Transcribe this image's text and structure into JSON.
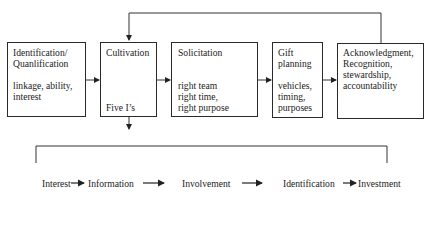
{
  "diagram": {
    "boxes": [
      {
        "id": "identification",
        "title_lines": [
          "Identification/",
          "Quanlification"
        ],
        "detail_lines": [
          "linkage, ability,",
          "interest"
        ]
      },
      {
        "id": "cultivation",
        "title_lines": [
          "Cultivation"
        ],
        "detail_lines": [
          "Five I’s"
        ]
      },
      {
        "id": "solicitation",
        "title_lines": [
          "Solicitation"
        ],
        "detail_lines": [
          "right team",
          "right time,",
          "right purpose"
        ]
      },
      {
        "id": "gift-planning",
        "title_lines": [
          "Gift",
          "planning"
        ],
        "detail_lines": [
          "vehicles,",
          "timing,",
          "purposes"
        ]
      },
      {
        "id": "acknowledgment",
        "title_lines": [
          "Acknowledgment,",
          "Recognition,",
          "stewardship,",
          "accountability"
        ],
        "detail_lines": []
      }
    ],
    "five_is_sequence": [
      "Interest",
      "Information",
      "Involvement",
      "Identification",
      "Investment"
    ],
    "connections": [
      {
        "from": "identification",
        "to": "cultivation",
        "type": "arrow"
      },
      {
        "from": "cultivation",
        "to": "solicitation",
        "type": "arrow"
      },
      {
        "from": "solicitation",
        "to": "gift-planning",
        "type": "arrow"
      },
      {
        "from": "gift-planning",
        "to": "acknowledgment",
        "type": "arrow"
      },
      {
        "from": "acknowledgment",
        "to": "cultivation",
        "type": "feedback-loop"
      },
      {
        "from": "cultivation",
        "to": "five-is-sequence",
        "type": "expand-bracket"
      }
    ],
    "colors": {
      "stroke": "#2a2a2a",
      "text": "#222222",
      "background": "#ffffff"
    }
  }
}
